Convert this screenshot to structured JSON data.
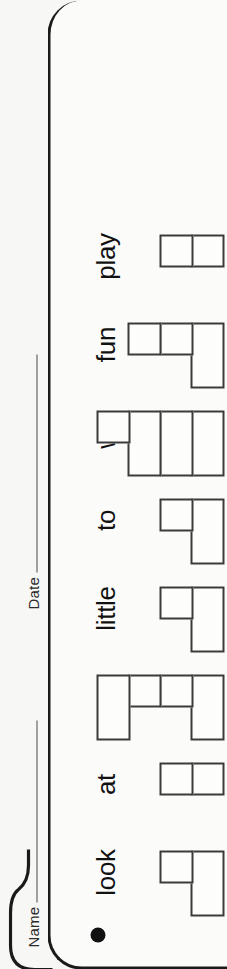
{
  "worksheet": {
    "fields": [
      {
        "label": "Name",
        "value": ""
      },
      {
        "label": "Date",
        "value": ""
      }
    ],
    "markers": {
      "bullet": "filled-circle",
      "square": "filled-square"
    }
  },
  "chart_data": {
    "type": "bar",
    "title": "",
    "subtitle": "",
    "xlabel": "",
    "ylabel": "",
    "orientation": "vertical",
    "grid": false,
    "legend": false,
    "note": "Each column is a stack of hand-drawn boxes; narrow boxes are single units, wide boxes are double-width units.",
    "categories": [
      "look",
      "at",
      "me",
      "little",
      "to",
      "we",
      "fun",
      "play"
    ],
    "values": [
      2,
      2,
      4,
      2,
      2,
      4,
      3,
      2
    ],
    "ylim": [
      0,
      5
    ],
    "columns": [
      {
        "label": "look",
        "count": 2,
        "cells": [
          "wide",
          "narrow"
        ]
      },
      {
        "label": "at",
        "count": 2,
        "cells": [
          "narrow",
          "narrow"
        ]
      },
      {
        "label": "me",
        "count": 4,
        "cells": [
          "wide",
          "narrow",
          "narrow",
          "wide"
        ]
      },
      {
        "label": "little",
        "count": 2,
        "cells": [
          "wide",
          "narrow"
        ]
      },
      {
        "label": "to",
        "count": 2,
        "cells": [
          "wide",
          "narrow"
        ]
      },
      {
        "label": "we",
        "count": 4,
        "cells": [
          "wide",
          "wide",
          "wide",
          "narrow"
        ]
      },
      {
        "label": "fun",
        "count": 3,
        "cells": [
          "wide",
          "narrow",
          "narrow"
        ]
      },
      {
        "label": "play",
        "count": 2,
        "cells": [
          "narrow",
          "narrow"
        ]
      }
    ]
  },
  "colors": {
    "ink": "#1a1a1a",
    "cell_stroke": "#3b3b3b",
    "paper": "#f7f7f5",
    "card": "#fbfbfa"
  }
}
